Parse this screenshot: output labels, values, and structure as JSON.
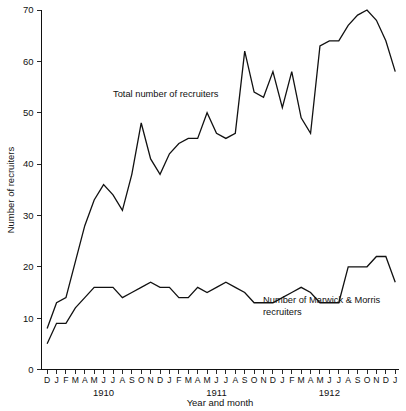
{
  "chart_data": {
    "type": "line",
    "title": "",
    "xlabel": "Year and month",
    "ylabel": "Number of recruiters",
    "ylim": [
      0,
      70
    ],
    "yticks": [
      0,
      10,
      20,
      30,
      40,
      50,
      60,
      70
    ],
    "grid": false,
    "legend_position": "inline-annotations",
    "x_tick_labels": [
      "D",
      "J",
      "F",
      "M",
      "A",
      "M",
      "J",
      "J",
      "A",
      "S",
      "O",
      "N",
      "D",
      "J",
      "F",
      "M",
      "A",
      "M",
      "J",
      "J",
      "A",
      "S",
      "O",
      "N",
      "D",
      "J",
      "F",
      "M",
      "A",
      "M",
      "J",
      "J",
      "A",
      "S",
      "O",
      "N",
      "D",
      "J"
    ],
    "x_group_labels": [
      {
        "label": "1910",
        "center_index": 6
      },
      {
        "label": "1911",
        "center_index": 18
      },
      {
        "label": "1912",
        "center_index": 30
      }
    ],
    "series": [
      {
        "name": "Total number of recruiters",
        "annotation": "Total number of recruiters",
        "annotation_x": 113,
        "annotation_y": 94,
        "values": [
          8,
          13,
          14,
          21,
          28,
          33,
          36,
          34,
          31,
          38,
          48,
          41,
          38,
          42,
          44,
          45,
          45,
          50,
          46,
          45,
          46,
          62,
          54,
          53,
          58,
          51,
          58,
          49,
          46,
          63,
          64,
          64,
          67,
          69,
          70,
          68,
          64,
          58
        ]
      },
      {
        "name": "Number of Marwick & Morris recruiters",
        "annotation": "Number of Marwick & Morris recruiters",
        "annotation_line_1": "Number of Marwick & Morris",
        "annotation_line_2": "recruiters",
        "annotation_x": 263,
        "annotation_y": 300,
        "values": [
          5,
          9,
          9,
          12,
          14,
          16,
          16,
          16,
          14,
          15,
          16,
          17,
          16,
          16,
          14,
          14,
          16,
          15,
          16,
          17,
          16,
          15,
          13,
          13,
          13,
          14,
          15,
          16,
          15,
          13,
          13,
          13,
          20,
          20,
          20,
          22,
          22,
          17
        ]
      }
    ],
    "colors": {
      "line": "#111111",
      "background": "#ffffff",
      "axis": "#111111"
    }
  },
  "annotations": {
    "total_label": "Total number of recruiters",
    "marwick_label_line1": "Number of Marwick & Morris",
    "marwick_label_line2": "recruiters"
  },
  "axes": {
    "y_title": "Number of recruiters",
    "x_title": "Year and month"
  }
}
